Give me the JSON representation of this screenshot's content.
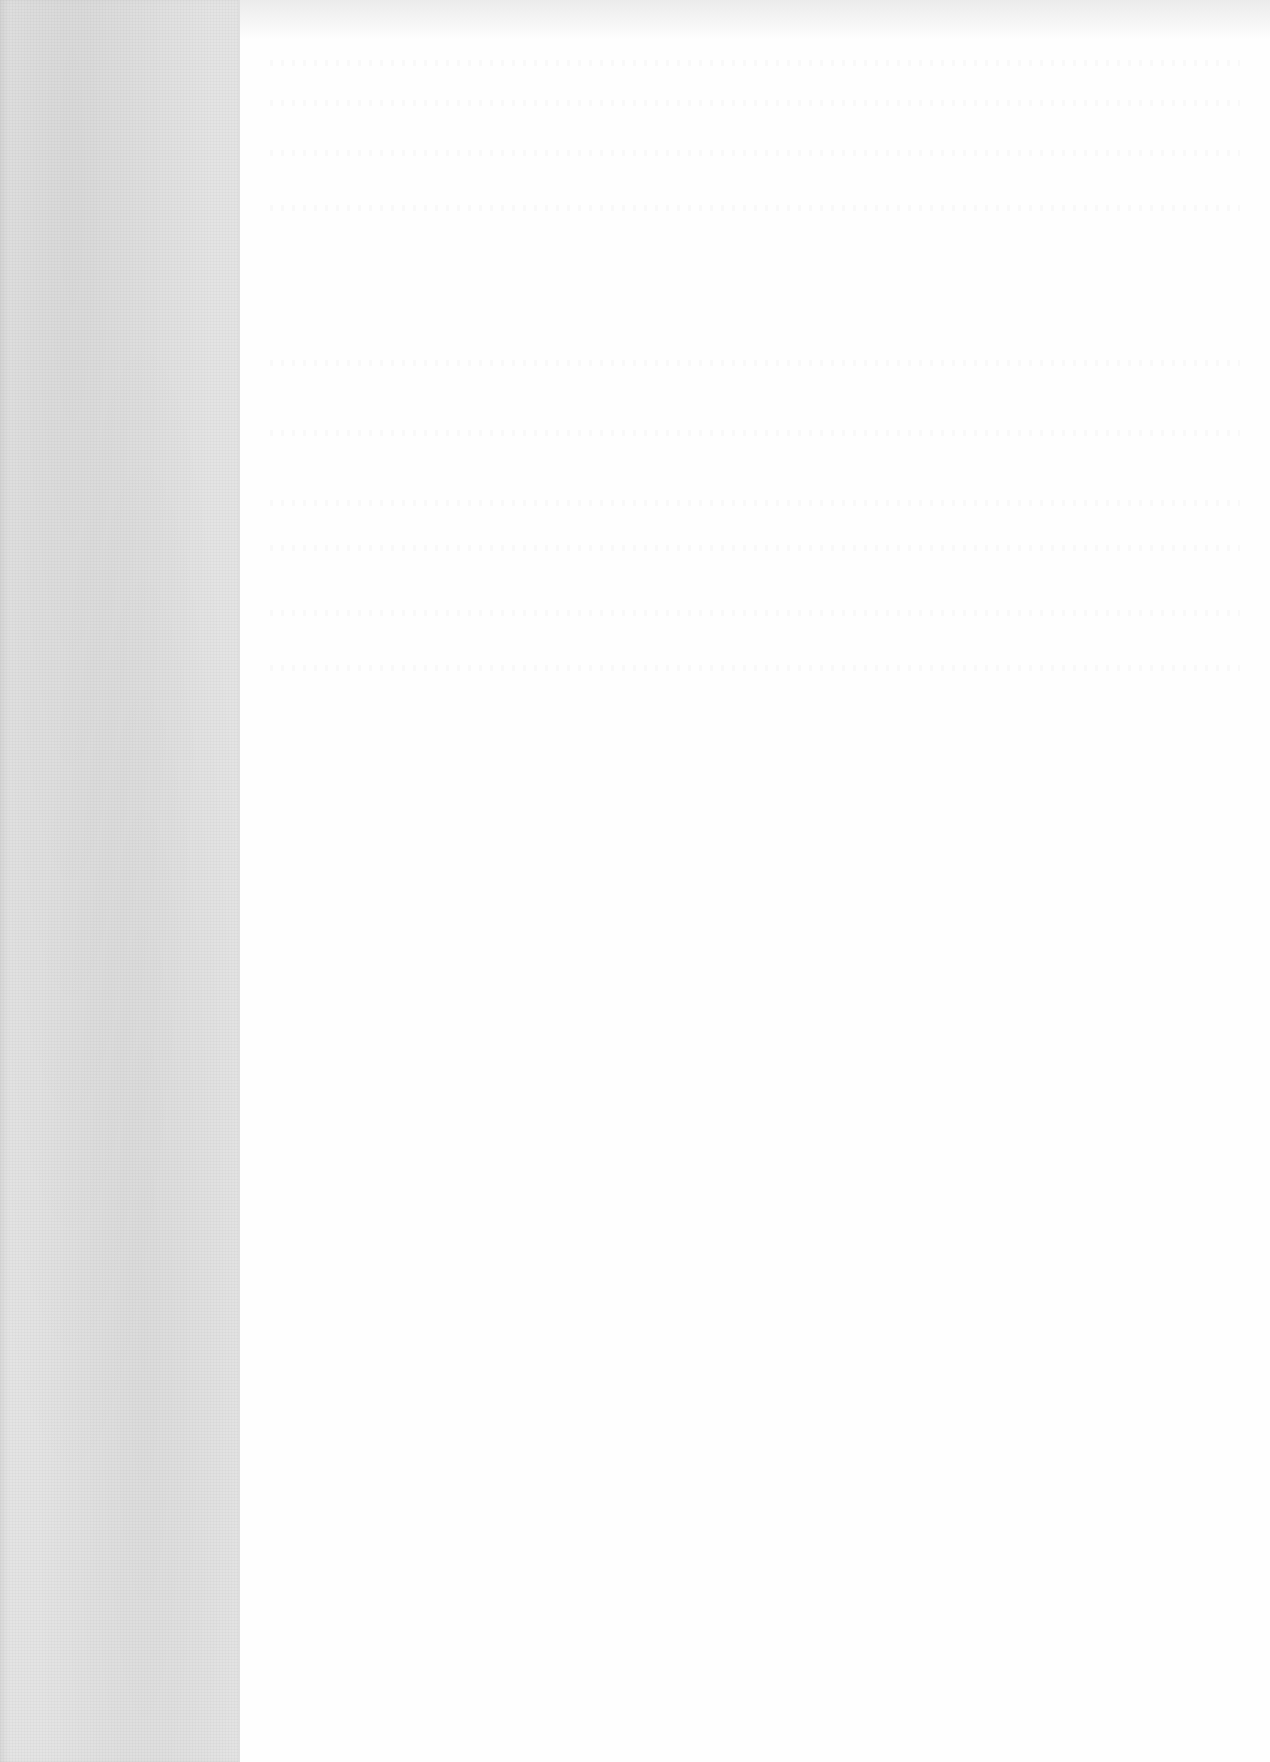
{
  "document": {
    "type": "scanned-page",
    "page_text": "",
    "colors": {
      "paper": "#fefefe",
      "binding_strip": "#e4e4e4"
    }
  }
}
